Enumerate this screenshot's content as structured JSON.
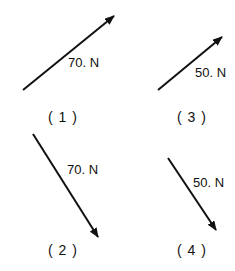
{
  "diagram": {
    "type": "force-vectors",
    "vectors": [
      {
        "id": "1",
        "magnitude_label": "70. N",
        "caption": "( 1 )",
        "direction": "up-right"
      },
      {
        "id": "2",
        "magnitude_label": "70. N",
        "caption": "( 2 )",
        "direction": "down-right"
      },
      {
        "id": "3",
        "magnitude_label": "50. N",
        "caption": "( 3 )",
        "direction": "up-right"
      },
      {
        "id": "4",
        "magnitude_label": "50. N",
        "caption": "( 4 )",
        "direction": "down-right"
      }
    ],
    "color": "#111111"
  }
}
